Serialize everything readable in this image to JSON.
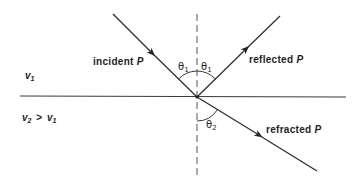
{
  "diagram": {
    "title": "",
    "colors": {
      "background": "#ffffff",
      "line": "#2b2b2b",
      "text": "#1e1e1e"
    },
    "labels": {
      "incident": {
        "word": "incident",
        "symbol": "P"
      },
      "reflected": {
        "word": "reflected",
        "symbol": "P"
      },
      "refracted": {
        "word": "refracted",
        "symbol": "P"
      }
    },
    "media": {
      "upper": {
        "symbol": "v",
        "subscript": "1"
      },
      "lower": {
        "symbol_left": "v",
        "subscript_left": "2",
        "relation": ">",
        "symbol_right": "v",
        "subscript_right": "1"
      }
    },
    "angles": {
      "incidence": {
        "symbol": "θ",
        "subscript": "1"
      },
      "reflection": {
        "symbol": "θ",
        "subscript": "1"
      },
      "refraction": {
        "symbol": "θ",
        "subscript": "2"
      }
    },
    "geometry": {
      "interface": {
        "x1": 20,
        "y1": 96,
        "x2": 346,
        "y2": 97
      },
      "normal": {
        "x": 197,
        "y1": 14,
        "y2": 178,
        "style": "dashed"
      },
      "point_of_incidence": {
        "x": 197,
        "y": 97
      },
      "incident_ray": {
        "x1": 113,
        "y1": 14,
        "x2": 197,
        "y2": 97,
        "arrow_at": [
          152,
          53
        ]
      },
      "reflected_ray": {
        "x1": 197,
        "y1": 97,
        "x2": 280,
        "y2": 16,
        "arrow_at": [
          245,
          50
        ]
      },
      "refracted_ray": {
        "x1": 197,
        "y1": 97,
        "x2": 317,
        "y2": 171,
        "arrow_at": [
          258,
          135
        ]
      }
    }
  }
}
